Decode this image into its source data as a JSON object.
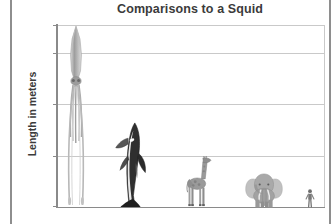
{
  "chart_data": {
    "type": "bar",
    "title": "Comparisons to a Squid",
    "xlabel": "",
    "ylabel": "Length in meters",
    "ylim": [
      0,
      18
    ],
    "yticks": [
      0,
      5,
      10,
      15,
      18
    ],
    "ytick_labels": [
      "0",
      "5",
      "10",
      "15",
      "18"
    ],
    "grid": true,
    "legend": false,
    "categories": [
      "Giant squid",
      "Killer whale",
      "Giraffe",
      "Elephant",
      "Human"
    ],
    "values": [
      18,
      8.5,
      5,
      3.5,
      1.8
    ],
    "units": "meters",
    "series": [
      {
        "name": "Length in meters",
        "values": [
          18,
          8.5,
          5,
          3.5,
          1.8
        ]
      }
    ],
    "items": [
      {
        "name": "Giant squid",
        "icon": "squid-figure",
        "value": 18,
        "label": "18"
      },
      {
        "name": "Killer whale",
        "icon": "orca-figure",
        "value": 8.5,
        "label": "8.5"
      },
      {
        "name": "Giraffe",
        "icon": "giraffe-figure",
        "value": 5,
        "label": "5"
      },
      {
        "name": "Elephant",
        "icon": "elephant-figure",
        "value": 3.5,
        "label": "3.5"
      },
      {
        "name": "Human",
        "icon": "human-figure",
        "value": 1.8,
        "label": "1.8"
      }
    ]
  },
  "colors": {
    "title_text": "#3b3b3b",
    "gridline": "#c9c9c9",
    "axis_line": "#8a8a8a",
    "margin_rule": "#8e8e8e",
    "background": "#ffffff",
    "figure_dark": "#2e2e2e",
    "figure_mid": "#8d8d8d",
    "figure_light": "#c6c6c6"
  }
}
